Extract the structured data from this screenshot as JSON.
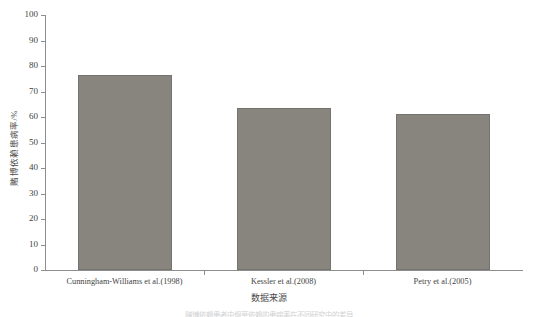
{
  "chart_data": {
    "type": "bar",
    "title": "",
    "xlabel": "数据来源",
    "ylabel": "赌博依赖患病率/%",
    "categories": [
      "Cunningham-Williams et al.(1998)",
      "Kessler et al.(2008)",
      "Petry et al.(2005)"
    ],
    "values": [
      76.4,
      63.5,
      61.3
    ],
    "ylim": [
      0,
      100
    ],
    "yticks": [
      0,
      10,
      20,
      30,
      40,
      50,
      60,
      70,
      80,
      90,
      100
    ],
    "ytick_labels": [
      "0",
      "10",
      "20",
      "30",
      "40",
      "50",
      "60",
      "70",
      "80",
      "90",
      "100"
    ],
    "grid": false,
    "legend": null,
    "bar_color": "#88857f",
    "bar_border_color": "#76736e",
    "axis_color": "#8e8e8e"
  },
  "caption": {
    "text": "赌博依赖患者中烟草依赖的患病率在不同研究中的差异"
  }
}
